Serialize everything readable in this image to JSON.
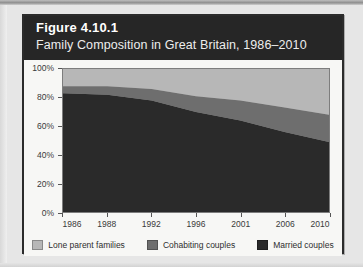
{
  "figure": {
    "number": "Figure 4.10.1",
    "title": "Family Composition in Great Britain, 1986–2010"
  },
  "colors": {
    "lone_parent": "#b7b7b7",
    "cohabiting": "#6e6e6e",
    "married": "#2a2a2a",
    "header_bg": "#262626",
    "figure_bg": "#f7f7f5",
    "page_bg": "#e6e6e6",
    "plot_border": "#7d7d7d",
    "axis_text": "#3a3a3a"
  },
  "legend": {
    "position": "bottom",
    "items": [
      {
        "label": "Lone parent families",
        "color": "#b7b7b7"
      },
      {
        "label": "Cohabiting couples",
        "color": "#6e6e6e"
      },
      {
        "label": "Married couples",
        "color": "#2a2a2a"
      }
    ]
  },
  "axes": {
    "y_ticks": [
      "0%",
      "20%",
      "40%",
      "60%",
      "80%",
      "100%"
    ],
    "x_ticks": [
      "1986",
      "1988",
      "1992",
      "1996",
      "2001",
      "2006",
      "2010"
    ]
  },
  "chart_data": {
    "type": "area",
    "title": "Family Composition in Great Britain, 1986–2010",
    "subtitle": "Figure 4.10.1",
    "xlabel": "",
    "ylabel": "",
    "stacked": true,
    "stack_total": 100,
    "grid": false,
    "legend_position": "bottom",
    "ylim": [
      0,
      100
    ],
    "yticks": [
      0,
      20,
      40,
      60,
      80,
      100
    ],
    "ytick_labels": [
      "0%",
      "20%",
      "40%",
      "60%",
      "80%",
      "100%"
    ],
    "categories": [
      "1986",
      "1988",
      "1992",
      "1996",
      "2001",
      "2006",
      "2010"
    ],
    "series": [
      {
        "name": "Married couples",
        "color": "#2a2a2a",
        "values": [
          83,
          82,
          78,
          70,
          64,
          56,
          49
        ]
      },
      {
        "name": "Cohabiting couples",
        "color": "#6e6e6e",
        "values": [
          5,
          6,
          8,
          11,
          14,
          17,
          19
        ]
      },
      {
        "name": "Lone parent families",
        "color": "#b7b7b7",
        "values": [
          12,
          12,
          14,
          19,
          22,
          27,
          32
        ]
      }
    ]
  }
}
